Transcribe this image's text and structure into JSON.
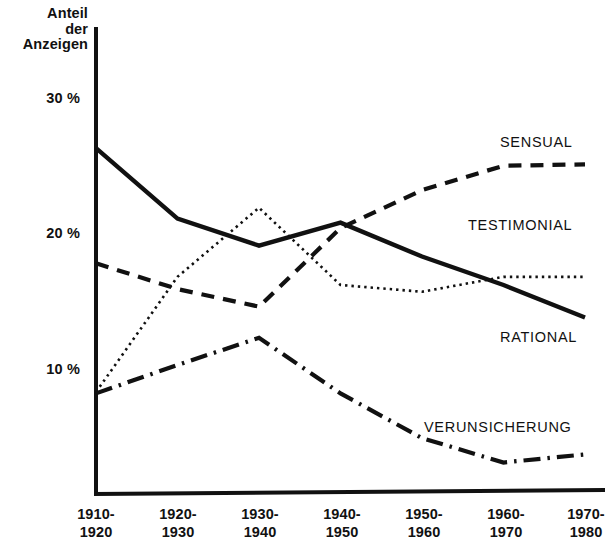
{
  "chart_data": {
    "type": "line",
    "title": "",
    "subtitle": "",
    "ylabel": "Anteil\nder\nAnzeigen",
    "xlabel": "",
    "categories": [
      "1910-\n1920",
      "1920-\n1930",
      "1930-\n1940",
      "1940-\n1950",
      "1950-\n1960",
      "1960-\n1970",
      "1970-\n1980"
    ],
    "ytick_labels": [
      "30 %",
      "20 %",
      "10 %"
    ],
    "ytick_values": [
      30,
      20,
      10
    ],
    "ylim": [
      0,
      33
    ],
    "grid": false,
    "legend_position": "inline-right",
    "units": "percent",
    "series": [
      {
        "name": "RATIONAL",
        "style": "solid",
        "color": "#111111",
        "values": [
          26.3,
          21.1,
          19.1,
          20.8,
          18.3,
          16.2,
          13.8
        ]
      },
      {
        "name": "SENSUAL",
        "style": "dashed",
        "color": "#111111",
        "values": [
          17.8,
          15.9,
          14.6,
          20.4,
          23.2,
          25.0,
          25.1
        ]
      },
      {
        "name": "TESTIMONIAL",
        "style": "dotted",
        "color": "#111111",
        "values": [
          8.3,
          16.8,
          21.9,
          16.2,
          15.7,
          16.8,
          16.8
        ]
      },
      {
        "name": "VERUNSICHERUNG",
        "style": "dashdot",
        "color": "#111111",
        "values": [
          8.2,
          10.3,
          12.3,
          8.2,
          4.9,
          3.1,
          3.7
        ]
      }
    ],
    "annotations": [
      {
        "text": "SENSUAL",
        "x": 500,
        "y": 143
      },
      {
        "text": "TESTIMONIAL",
        "x": 468,
        "y": 226
      },
      {
        "text": "RATIONAL",
        "x": 500,
        "y": 338
      },
      {
        "text": "VERUNSICHERUNG",
        "x": 424,
        "y": 428
      }
    ]
  },
  "axes": {
    "y_axis_label": "Anteil\nder\nAnzeigen",
    "ticks": [
      {
        "label": "30 %"
      },
      {
        "label": "20 %"
      },
      {
        "label": "10 %"
      }
    ]
  }
}
